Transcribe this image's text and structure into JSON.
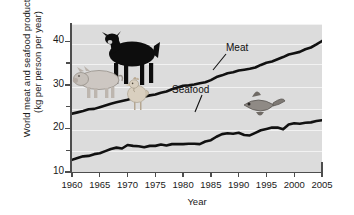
{
  "chart_data": {
    "type": "line",
    "title": "",
    "xlabel": "Year",
    "ylabel_line1": "World meat and seafood production",
    "ylabel_line2": "(kg per person per year)",
    "xlim": [
      1960,
      2005
    ],
    "ylim": [
      10,
      44
    ],
    "grid": true,
    "legend_position": "inline-annotations",
    "xticks": [
      1960,
      1965,
      1970,
      1975,
      1980,
      1985,
      1990,
      1995,
      2000,
      2005
    ],
    "yticks": [
      10,
      20,
      30,
      40
    ],
    "yticks_minor": [
      15,
      25,
      35
    ],
    "x": [
      1960,
      1961,
      1962,
      1963,
      1964,
      1965,
      1966,
      1967,
      1968,
      1969,
      1970,
      1971,
      1972,
      1973,
      1974,
      1975,
      1976,
      1977,
      1978,
      1979,
      1980,
      1981,
      1982,
      1983,
      1984,
      1985,
      1986,
      1987,
      1988,
      1989,
      1990,
      1991,
      1992,
      1993,
      1994,
      1995,
      1996,
      1997,
      1998,
      1999,
      2000,
      2001,
      2002,
      2003,
      2004,
      2005
    ],
    "series": [
      {
        "name": "Meat",
        "color": "#111111",
        "values": [
          23.4,
          23.7,
          24.0,
          24.4,
          24.5,
          24.9,
          25.3,
          25.7,
          26.0,
          26.3,
          26.6,
          27.0,
          27.3,
          27.3,
          27.6,
          27.8,
          28.2,
          28.5,
          29.0,
          29.4,
          29.8,
          29.9,
          30.1,
          30.4,
          30.6,
          31.1,
          31.8,
          32.2,
          32.7,
          32.9,
          33.3,
          33.5,
          33.7,
          34.0,
          34.6,
          35.1,
          35.4,
          35.9,
          36.4,
          37.0,
          37.3,
          37.6,
          38.2,
          38.6,
          39.3,
          40.1
        ]
      },
      {
        "name": "Seafood",
        "color": "#111111",
        "values": [
          12.8,
          13.2,
          13.6,
          13.7,
          14.1,
          14.3,
          14.8,
          15.3,
          15.6,
          15.4,
          16.2,
          16.0,
          15.9,
          15.7,
          16.0,
          16.0,
          16.3,
          16.1,
          16.4,
          16.4,
          16.4,
          16.5,
          16.5,
          16.4,
          17.0,
          17.3,
          18.1,
          18.7,
          18.9,
          18.8,
          19.0,
          18.5,
          18.4,
          19.0,
          19.6,
          19.9,
          20.2,
          20.2,
          19.8,
          20.9,
          21.2,
          21.1,
          21.3,
          21.4,
          21.7,
          21.9
        ]
      }
    ],
    "annotations": [
      {
        "label": "Meat",
        "x": 1987,
        "y": 38.7
      },
      {
        "label": "Seafood",
        "x": 1982.5,
        "y": 23.1
      }
    ],
    "illustrations": [
      {
        "name": "pig-illustration"
      },
      {
        "name": "cow-illustration"
      },
      {
        "name": "chicken-illustration"
      },
      {
        "name": "fish-illustration"
      }
    ]
  }
}
